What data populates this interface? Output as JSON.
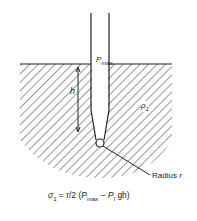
{
  "diagram": {
    "labels": {
      "pressure": "P",
      "pressure_sub": "max",
      "height": "h",
      "density": "ρ",
      "density_sub": "1",
      "radius": "Radius ",
      "radius_var": "r"
    },
    "formula": {
      "lhs": "σ",
      "lhs_sub": "1",
      "eq": " = r/2 (",
      "p": "P",
      "p_sub": "max",
      "minus": " − ",
      "rho": "P",
      "rho_sub": "l",
      "tail": " gh)"
    },
    "colors": {
      "line": "#222222",
      "background": "#ffffff"
    }
  }
}
